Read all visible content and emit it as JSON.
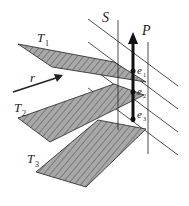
{
  "diagram": {
    "labels": {
      "S": "S",
      "P": "P",
      "T1": "T",
      "T1_sub": "1",
      "T2": "T",
      "T2_sub": "2",
      "T3": "T",
      "T3_sub": "3",
      "r": "r",
      "e1": "e",
      "e1_sub": "1",
      "e2": "e",
      "e2_sub": "2",
      "e3": "e",
      "e3_sub": "3"
    },
    "colors": {
      "plane_fill": "#a8a8a8",
      "line": "#222222",
      "background": "#ffffff"
    }
  }
}
